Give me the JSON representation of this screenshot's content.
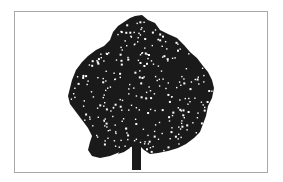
{
  "image": {
    "subject": "tree-silhouette",
    "colors": {
      "background": "#ffffff",
      "frame_border": "#a8a8a8",
      "silhouette": "#1a1a1a",
      "speckle": "#ffffff"
    },
    "frame": {
      "x": 14,
      "y": 11,
      "width": 254,
      "height": 162
    },
    "canopy_outline": "M135,16 L142,15 L148,20 L155,23 L160,30 L168,34 L177,38 L184,45 L190,52 L197,58 L203,66 L208,72 L212,80 L214,88 L212,98 L208,106 L206,116 L203,124 L200,132 L194,138 L186,144 L178,148 L168,151 L158,153 L150,154 L144,150 L140,146 L134,146 L128,148 L120,152 L110,156 L100,158 L92,156 L88,150 L90,142 L92,136 L88,128 L82,120 L76,112 L70,104 L68,96 L70,88 L72,80 L76,70 L82,62 L88,56 L96,50 L104,46 L110,40 L113,32 L118,26 L124,22 L130,18 Z",
    "trunk": {
      "x": 132,
      "y": 138,
      "width": 9,
      "height": 32
    },
    "branch": "M128,142 L122,148 L118,154 L124,152 L130,148 Z"
  }
}
